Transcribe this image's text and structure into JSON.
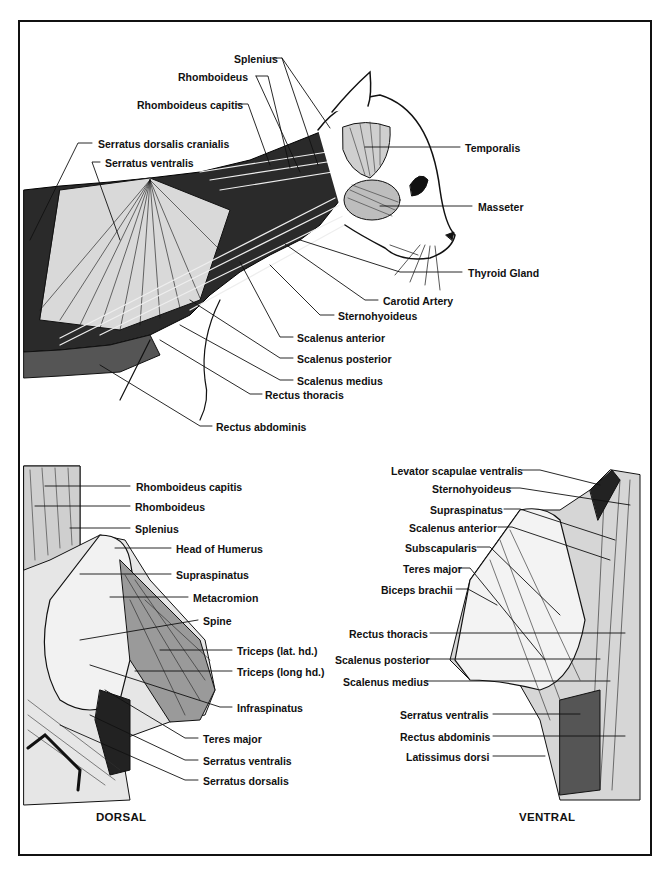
{
  "figure": {
    "top_panel": {
      "labels": [
        {
          "text": "Splenius",
          "x": 234,
          "y": 53
        },
        {
          "text": "Rhomboideus",
          "x": 178,
          "y": 71
        },
        {
          "text": "Rhomboideus capitis",
          "x": 137,
          "y": 101
        },
        {
          "text": "Serratus dorsalis cranialis",
          "x": 98,
          "y": 140
        },
        {
          "text": "Serratus ventralis",
          "x": 105,
          "y": 158
        },
        {
          "text": "Temporalis",
          "x": 465,
          "y": 143
        },
        {
          "text": "Masseter",
          "x": 478,
          "y": 202
        },
        {
          "text": "Thyroid Gland",
          "x": 468,
          "y": 267
        },
        {
          "text": "Carotid Artery",
          "x": 383,
          "y": 296
        },
        {
          "text": "Sternohyoideus",
          "x": 338,
          "y": 311
        },
        {
          "text": "Scalenus anterior",
          "x": 297,
          "y": 333
        },
        {
          "text": "Scalenus posterior",
          "x": 297,
          "y": 354
        },
        {
          "text": "Scalenus medius",
          "x": 297,
          "y": 376
        },
        {
          "text": "Rectus thoracis",
          "x": 265,
          "y": 390
        },
        {
          "text": "Rectus abdominis",
          "x": 216,
          "y": 422
        }
      ]
    },
    "dorsal_panel": {
      "caption": "DORSAL",
      "labels": [
        {
          "text": "Rhomboideus capitis",
          "x": 136,
          "y": 482
        },
        {
          "text": "Rhomboideus",
          "x": 135,
          "y": 502
        },
        {
          "text": "Splenius",
          "x": 135,
          "y": 524
        },
        {
          "text": "Head of Humerus",
          "x": 176,
          "y": 544
        },
        {
          "text": "Supraspinatus",
          "x": 176,
          "y": 570
        },
        {
          "text": "Metacromion",
          "x": 193,
          "y": 593
        },
        {
          "text": "Spine",
          "x": 203,
          "y": 616
        },
        {
          "text": "Triceps (lat. hd.)",
          "x": 237,
          "y": 646
        },
        {
          "text": "Triceps (long hd.)",
          "x": 237,
          "y": 667
        },
        {
          "text": "Infraspinatus",
          "x": 237,
          "y": 703
        },
        {
          "text": "Teres major",
          "x": 203,
          "y": 734
        },
        {
          "text": "Serratus ventralis",
          "x": 203,
          "y": 756
        },
        {
          "text": "Serratus dorsalis",
          "x": 203,
          "y": 776
        }
      ]
    },
    "ventral_panel": {
      "caption": "VENTRAL",
      "labels": [
        {
          "text": "Levator scapulae ventralis",
          "x": 391,
          "y": 466
        },
        {
          "text": "Sternohyoideus",
          "x": 432,
          "y": 484
        },
        {
          "text": "Supraspinatus",
          "x": 430,
          "y": 505
        },
        {
          "text": "Scalenus anterior",
          "x": 409,
          "y": 523
        },
        {
          "text": "Subscapularis",
          "x": 405,
          "y": 543
        },
        {
          "text": "Teres major",
          "x": 403,
          "y": 564
        },
        {
          "text": "Biceps brachii",
          "x": 381,
          "y": 585
        },
        {
          "text": "Rectus thoracis",
          "x": 349,
          "y": 629
        },
        {
          "text": "Scalenus posterior",
          "x": 340,
          "y": 655
        },
        {
          "text": "Scalenus medius",
          "x": 345,
          "y": 677
        },
        {
          "text": "Serratus ventralis",
          "x": 400,
          "y": 710
        },
        {
          "text": "Rectus abdominis",
          "x": 400,
          "y": 732
        },
        {
          "text": "Latissimus dorsi",
          "x": 406,
          "y": 752
        }
      ]
    }
  }
}
